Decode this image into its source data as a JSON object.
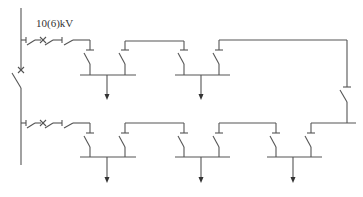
{
  "diagram": {
    "type": "single-line electrical distribution diagram",
    "voltage_label": "10(6)kV",
    "colors": {
      "line": "#555555",
      "text": "#333333",
      "background": "#ffffff"
    },
    "elements": {
      "main_bus": "vertical incoming bus with isolating switch and breaker",
      "feeders": [
        {
          "row": "top",
          "bus_sections": 2,
          "outgoing_arrows": 2
        },
        {
          "row": "bottom",
          "bus_sections": 3,
          "outgoing_arrows": 3
        }
      ],
      "tie_line": "right-side tie connecting top and bottom rows through a disconnect switch"
    }
  }
}
